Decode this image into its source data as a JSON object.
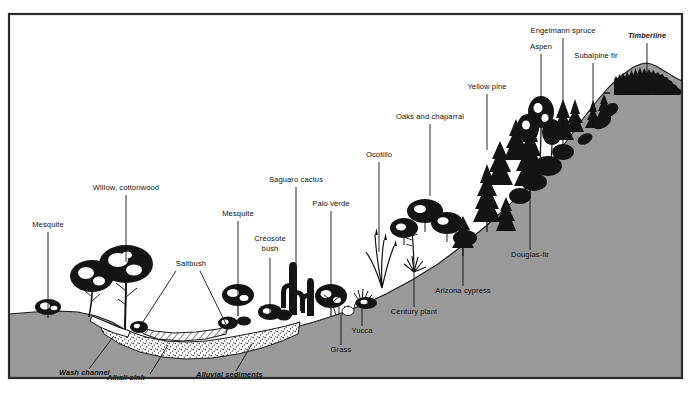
{
  "figure": {
    "colors": {
      "ground_fill": "#9a9a9a",
      "ink": "#111111",
      "frame": "#2b2b2b",
      "paper": "#ffffff"
    }
  },
  "labels": [
    {
      "id": "mesquite-left",
      "text": "Mesquite",
      "style": "roman",
      "anchor": "middle",
      "text_x": 48,
      "text_y": 227,
      "leader": [
        [
          48,
          232
        ],
        [
          48,
          312
        ]
      ]
    },
    {
      "id": "willow-cottonwood",
      "text": "Willow, cottonwood",
      "style": "roman",
      "anchor": "middle",
      "text_x": 126,
      "text_y": 190,
      "leader": [
        [
          126,
          195
        ],
        [
          126,
          262
        ]
      ]
    },
    {
      "id": "saltbush",
      "text": "Saltbush",
      "style": "roman",
      "anchor": "middle",
      "text_x": 191,
      "text_y": 266,
      "leader": [
        [
          176,
          271
        ],
        [
          139,
          328
        ]
      ]
    },
    {
      "id": "saltbush-2",
      "text": "",
      "style": "roman",
      "anchor": "middle",
      "text_x": 191,
      "text_y": 266,
      "leader": [
        [
          200,
          271
        ],
        [
          226,
          324
        ]
      ]
    },
    {
      "id": "mesquite-right",
      "text": "Mesquite",
      "style": "roman",
      "anchor": "middle",
      "text_x": 238,
      "text_y": 216,
      "leader": [
        [
          238,
          221
        ],
        [
          238,
          297
        ]
      ]
    },
    {
      "id": "creosote-bush",
      "text": "Creosote",
      "style": "roman",
      "anchor": "middle",
      "text_x": 270,
      "text_y": 241,
      "leader": [
        [
          270,
          258
        ],
        [
          270,
          314
        ]
      ]
    },
    {
      "id": "creosote-bush-2",
      "text": "bush",
      "style": "roman",
      "anchor": "middle",
      "text_x": 270,
      "text_y": 251,
      "leader": null
    },
    {
      "id": "saguaro-cactus",
      "text": "Saguaro cactus",
      "style": "roman",
      "anchor": "middle",
      "text_x": 296,
      "text_y": 182,
      "leader": [
        [
          296,
          187
        ],
        [
          296,
          264
        ]
      ]
    },
    {
      "id": "palo-verde",
      "text": "Palo verde",
      "style": "roman",
      "anchor": "middle",
      "text_x": 331,
      "text_y": 206,
      "leader": [
        [
          331,
          211
        ],
        [
          331,
          285
        ]
      ]
    },
    {
      "id": "grass",
      "text": "Grass",
      "style": "roman",
      "anchor": "middle",
      "text_x": 341,
      "text_y": 352,
      "leader": [
        [
          341,
          345
        ],
        [
          341,
          315
        ]
      ]
    },
    {
      "id": "yucca",
      "text": "Yucca",
      "style": "roman",
      "anchor": "middle",
      "text_x": 362,
      "text_y": 333,
      "leader": [
        [
          362,
          326
        ],
        [
          362,
          305
        ]
      ]
    },
    {
      "id": "ocotillo",
      "text": "Ocotillo",
      "style": "roman",
      "anchor": "middle",
      "text_x": 379,
      "text_y": 157,
      "leader": [
        [
          379,
          162
        ],
        [
          379,
          252
        ]
      ]
    },
    {
      "id": "century-plant",
      "text": "Century plant",
      "style": "roman",
      "anchor": "middle",
      "text_x": 414,
      "text_y": 314,
      "leader": [
        [
          414,
          307
        ],
        [
          414,
          272
        ]
      ]
    },
    {
      "id": "oaks-chaparral",
      "text": "Oaks and chaparral",
      "style": "roman",
      "anchor": "middle",
      "text_x": 430,
      "text_y": 119,
      "leader": [
        [
          430,
          124
        ],
        [
          430,
          196
        ]
      ]
    },
    {
      "id": "arizona-cypress",
      "text": "Arizona cypress",
      "style": "roman",
      "anchor": "middle",
      "text_x": 463,
      "text_y": 293,
      "leader": [
        [
          463,
          286
        ],
        [
          463,
          248
        ]
      ]
    },
    {
      "id": "yellow-pine",
      "text": "Yellow pine",
      "style": "roman",
      "anchor": "middle",
      "text_x": 487,
      "text_y": 89,
      "leader": [
        [
          487,
          94
        ],
        [
          487,
          150
        ]
      ]
    },
    {
      "id": "douglas-fir",
      "text": "Douglas-fir",
      "style": "roman",
      "anchor": "middle",
      "text_x": 530,
      "text_y": 257,
      "leader": [
        [
          530,
          250
        ],
        [
          530,
          182
        ]
      ]
    },
    {
      "id": "aspen",
      "text": "Aspen",
      "style": "roman",
      "anchor": "middle",
      "text_x": 541,
      "text_y": 49,
      "leader": [
        [
          541,
          54
        ],
        [
          541,
          104
        ]
      ]
    },
    {
      "id": "engelmann-spruce",
      "text": "Engelmann spruce",
      "style": "roman",
      "anchor": "middle",
      "text_x": 563,
      "text_y": 33,
      "leader": [
        [
          563,
          38
        ],
        [
          563,
          131
        ]
      ]
    },
    {
      "id": "subalpine-fir",
      "text": "Subalpine fir",
      "style": "roman",
      "anchor": "middle",
      "text_x": 596,
      "text_y": 58,
      "leader": [
        [
          593,
          63
        ],
        [
          593,
          126
        ]
      ]
    },
    {
      "id": "timberline",
      "text": "Timberline",
      "style": "italic",
      "anchor": "middle",
      "text_x": 647,
      "text_y": 38,
      "leader": [
        [
          647,
          43
        ],
        [
          647,
          74
        ]
      ]
    },
    {
      "id": "wash-channel",
      "text": "Wash channel",
      "style": "italic",
      "anchor": "start",
      "text_x": 59,
      "text_y": 375,
      "leader": [
        [
          89,
          369
        ],
        [
          113,
          337
        ]
      ]
    },
    {
      "id": "alkali-sink",
      "text": "Alkali sink",
      "style": "italic",
      "anchor": "start",
      "text_x": 107,
      "text_y": 380,
      "leader": [
        [
          150,
          374
        ],
        [
          168,
          345
        ]
      ]
    },
    {
      "id": "alluvial-sediments",
      "text": "Alluvial sediments",
      "style": "italic",
      "anchor": "start",
      "text_x": 196,
      "text_y": 377,
      "leader": [
        [
          236,
          371
        ],
        [
          252,
          344
        ]
      ]
    }
  ],
  "terrain": {
    "description": "Gray-filled ground profile rising left-to-right from desert wash to mountain summit",
    "timberline_note": "Dashed horizontal line marking timberline elevation near summit"
  },
  "chart_data": {
    "type": "diagram",
    "zones": [
      {
        "name": "Wash channel",
        "vegetation": [
          "Mesquite",
          "Willow, cottonwood"
        ]
      },
      {
        "name": "Alkali sink",
        "vegetation": [
          "Saltbush"
        ]
      },
      {
        "name": "Alluvial sediments",
        "vegetation": [
          "Mesquite",
          "Creosote bush",
          "Saguaro cactus",
          "Palo verde"
        ]
      },
      {
        "name": "Lower bajada",
        "vegetation": [
          "Grass",
          "Yucca",
          "Ocotillo",
          "Century plant"
        ]
      },
      {
        "name": "Montane slope",
        "vegetation": [
          "Oaks and chaparral",
          "Arizona cypress",
          "Yellow pine",
          "Douglas-fir"
        ]
      },
      {
        "name": "Subalpine",
        "vegetation": [
          "Aspen",
          "Engelmann spruce",
          "Subalpine fir"
        ]
      },
      {
        "name": "Timberline",
        "vegetation": []
      }
    ]
  }
}
